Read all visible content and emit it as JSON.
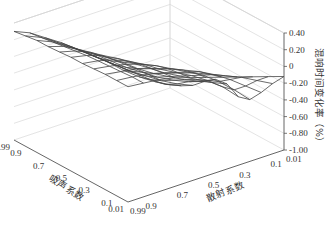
{
  "chart_data": {
    "type": "surface3d",
    "title": "",
    "xlabel": "吸声系数",
    "ylabel": "散射系数",
    "zlabel": "混响时间变化率（%）",
    "x_ticks": [
      "0.99",
      "0.9",
      "0.7",
      "0.5",
      "0.3",
      "0.1",
      "0.01"
    ],
    "y_ticks": [
      "0.99",
      "0.9",
      "0.7",
      "0.5",
      "0.3",
      "0.1",
      "0.01"
    ],
    "z_ticks": [
      "0.40",
      "0.20",
      "0",
      "-0.20",
      "-0.40",
      "-0.60",
      "-0.80",
      "-1.00"
    ],
    "zlim": [
      -1.0,
      0.4
    ],
    "grid": true,
    "x_values": [
      0.99,
      0.9,
      0.8,
      0.7,
      0.6,
      0.5,
      0.4,
      0.3,
      0.2,
      0.1,
      0.01
    ],
    "y_values": [
      0.99,
      0.9,
      0.8,
      0.7,
      0.6,
      0.5,
      0.4,
      0.3,
      0.2,
      0.1,
      0.01
    ],
    "z_values": [
      [
        0.3,
        0.22,
        0.1,
        -0.02,
        -0.16,
        -0.3,
        -0.44,
        -0.6,
        -0.74,
        -0.86,
        -0.96
      ],
      [
        0.32,
        0.24,
        0.12,
        0.0,
        -0.14,
        -0.28,
        -0.42,
        -0.56,
        -0.7,
        -0.82,
        -0.9
      ],
      [
        0.34,
        0.26,
        0.14,
        0.02,
        -0.12,
        -0.26,
        -0.4,
        -0.52,
        -0.64,
        -0.74,
        -0.82
      ],
      [
        0.34,
        0.28,
        0.18,
        0.06,
        -0.08,
        -0.22,
        -0.34,
        -0.46,
        -0.56,
        -0.64,
        -0.7
      ],
      [
        0.35,
        0.3,
        0.22,
        0.1,
        -0.02,
        -0.16,
        -0.28,
        -0.38,
        -0.48,
        -0.56,
        -0.6
      ],
      [
        0.36,
        0.32,
        0.26,
        0.16,
        0.04,
        -0.08,
        -0.2,
        -0.3,
        -0.4,
        -0.5,
        -0.58
      ],
      [
        0.36,
        0.33,
        0.28,
        0.2,
        0.1,
        -0.02,
        -0.12,
        -0.22,
        -0.34,
        -0.48,
        -0.66
      ],
      [
        0.37,
        0.34,
        0.3,
        0.24,
        0.16,
        0.06,
        -0.04,
        -0.14,
        -0.28,
        -0.44,
        -0.62
      ],
      [
        0.38,
        0.35,
        0.32,
        0.26,
        0.2,
        0.12,
        0.04,
        -0.06,
        -0.18,
        -0.32,
        -0.46
      ],
      [
        0.38,
        0.36,
        0.33,
        0.28,
        0.22,
        0.16,
        0.08,
        0.0,
        -0.08,
        -0.18,
        -0.28
      ],
      [
        0.38,
        0.36,
        0.34,
        0.3,
        0.24,
        0.18,
        0.12,
        0.06,
        0.0,
        -0.06,
        -0.12
      ]
    ],
    "legend": {
      "position": "bottom",
      "entries_visible_text": "-0.80 ~ -0.60  -0.60 ~ -0.40  -0.40 ~ -0.20  -0.20 ~ 0  0 ~ 0.20  0.20 ~ 0.40"
    }
  }
}
